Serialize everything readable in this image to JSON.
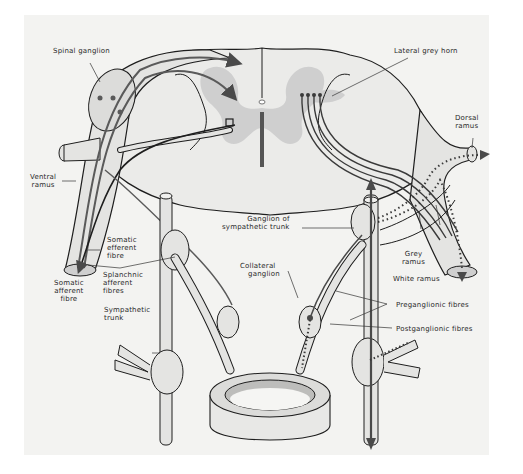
{
  "diagram": {
    "type": "anatomical-illustration",
    "colors": {
      "background": "#ffffff",
      "panel": "#f3f3f1",
      "grey_matter": "#cfcfcf",
      "outline": "#1e1e1e",
      "fibre": "#5a5a5a",
      "nerve_fill": "#e4e4e2"
    },
    "labels": {
      "spinal_ganglion": "Spinal ganglion",
      "lateral_grey_horn": "Lateral grey horn",
      "dorsal_ramus_1": "Dorsal",
      "dorsal_ramus_2": "ramus",
      "ventral_ramus_1": "Ventral",
      "ventral_ramus_2": "ramus",
      "ganglion_of_sympathetic_trunk_1": "Ganglion of",
      "ganglion_of_sympathetic_trunk_2": "sympathetic trunk",
      "somatic_efferent_fibre_1": "Somatic",
      "somatic_efferent_fibre_2": "efferent",
      "somatic_efferent_fibre_3": "fibre",
      "splanchnic_afferent_fibres_1": "Splanchnic",
      "splanchnic_afferent_fibres_2": "afferent",
      "splanchnic_afferent_fibres_3": "fibres",
      "somatic_afferent_fibre_1": "Somatic",
      "somatic_afferent_fibre_2": "afferent",
      "somatic_afferent_fibre_3": "fibre",
      "collateral_ganglion_1": "Collateral",
      "collateral_ganglion_2": "ganglion",
      "grey_ramus_1": "Grey",
      "grey_ramus_2": "ramus",
      "white_ramus": "White ramus",
      "preganglionic_fibres": "Preganglionic fibres",
      "postganglionic_fibres": "Postganglionic fibres",
      "sympathetic_trunk_1": "Sympathetic",
      "sympathetic_trunk_2": "trunk"
    }
  }
}
